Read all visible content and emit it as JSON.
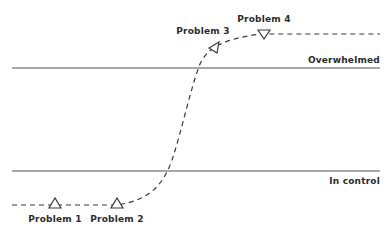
{
  "diagram": {
    "type": "threshold-curve",
    "thresholds": [
      {
        "id": "overwhelmed",
        "label": "Overwhelmed",
        "y": 68
      },
      {
        "id": "in-control",
        "label": "In control",
        "y": 171
      }
    ],
    "problems": [
      {
        "id": "problem-1",
        "label": "Problem 1",
        "marker": "triangle-up"
      },
      {
        "id": "problem-2",
        "label": "Problem 2",
        "marker": "triangle-up"
      },
      {
        "id": "problem-3",
        "label": "Problem 3",
        "marker": "triangle-left"
      },
      {
        "id": "problem-4",
        "label": "Problem 4",
        "marker": "triangle-down"
      }
    ],
    "curve_style": "dashed",
    "colors": {
      "background": "#ffffff",
      "line": "#8a8a8a",
      "curve": "#3a3a3a",
      "text": "#2b2b2b"
    }
  }
}
